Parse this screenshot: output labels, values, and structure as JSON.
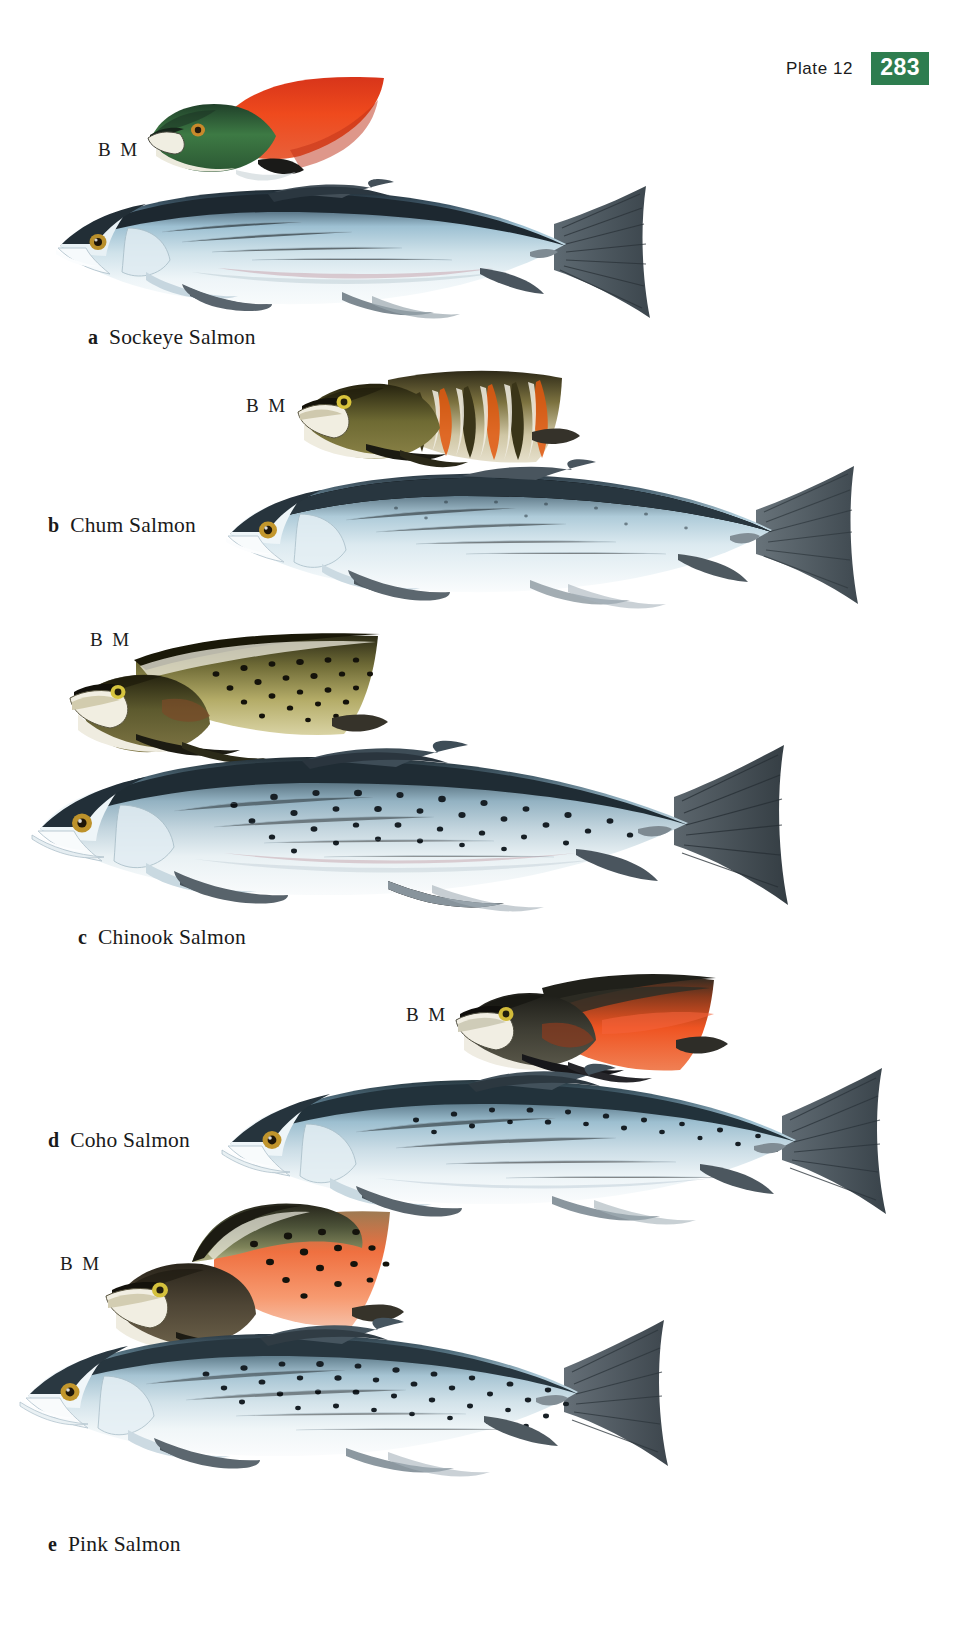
{
  "page": {
    "plate_label": "Plate 12",
    "page_number": "283",
    "badge_color": "#2e7d4f",
    "background": "#ffffff"
  },
  "annotations": {
    "breeding_male": "B M"
  },
  "species": [
    {
      "letter": "a",
      "name": "Sockeye Salmon",
      "breeding_male_label": "B M",
      "breeding_male_colors": {
        "head": "#2f6b3a",
        "body": "#e8401d",
        "jaw": "#f2efe6"
      },
      "adult_colors": {
        "back": "#24303a",
        "flank": "#bcd6e2",
        "belly": "#f4f8fa",
        "fin": "#4a5560",
        "eye": "#c8a63c"
      }
    },
    {
      "letter": "b",
      "name": "Chum Salmon",
      "breeding_male_label": "B M",
      "breeding_male_colors": {
        "head": "#6b6535",
        "body": "#e2dcc8",
        "bars": "#e05a22",
        "jaw": "#efece0"
      },
      "adult_colors": {
        "back": "#3a4750",
        "flank": "#cfdde6",
        "belly": "#f6f9fb",
        "fin": "#555f68",
        "eye": "#c8a63c"
      }
    },
    {
      "letter": "c",
      "name": "Chinook Salmon",
      "breeding_male_label": "B M",
      "breeding_male_colors": {
        "head": "#5d5a33",
        "body": "#b5ab6a",
        "spots": "#1d1a10",
        "jaw": "#efece0"
      },
      "adult_colors": {
        "back": "#2d3b42",
        "flank": "#c3d2da",
        "belly": "#f4f7f8",
        "fin": "#4b5660",
        "eye": "#c8a63c",
        "spots": "#1b2228"
      }
    },
    {
      "letter": "d",
      "name": "Coho Salmon",
      "breeding_male_label": "B M",
      "breeding_male_colors": {
        "head": "#3a3730",
        "body": "#e8491f",
        "jaw": "#efece0"
      },
      "adult_colors": {
        "back": "#2e3d46",
        "flank": "#c6d7e0",
        "belly": "#f5f8fa",
        "fin": "#4d5862",
        "eye": "#c8a63c",
        "spots": "#1b2228"
      }
    },
    {
      "letter": "e",
      "name": "Pink Salmon",
      "breeding_male_label": "B M",
      "breeding_male_colors": {
        "head": "#4a4337",
        "body": "#ef6a3c",
        "hump": "#3c4432",
        "jaw": "#efece0"
      },
      "adult_colors": {
        "back": "#35434c",
        "flank": "#ccdbe4",
        "belly": "#f6f9fb",
        "fin": "#525d66",
        "eye": "#c8a63c",
        "spots": "#1b2228"
      }
    }
  ]
}
